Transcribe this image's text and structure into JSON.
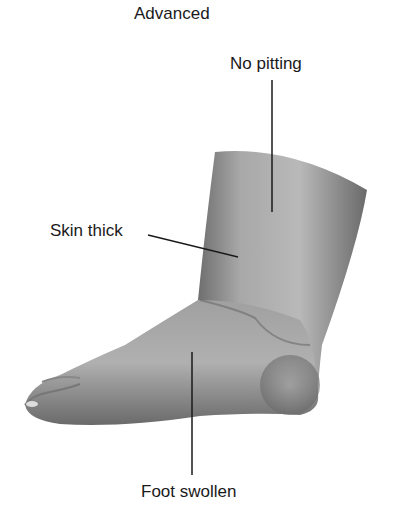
{
  "title": "Advanced",
  "labels": {
    "no_pitting": "No pitting",
    "skin_thick": "Skin thick",
    "foot_swollen": "Foot swollen"
  },
  "illustration": {
    "subject": "swollen-foot-lymphedema",
    "colors": {
      "skin_light": "#c8c8c8",
      "skin_mid": "#9a9a9a",
      "skin_dark": "#5a5a5a",
      "leader_line": "#1a1a1a"
    }
  }
}
